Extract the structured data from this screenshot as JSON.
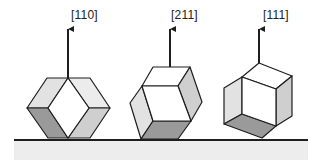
{
  "figure": {
    "colors": {
      "line": "#1e1e1e",
      "face_light": "#e2e2e2",
      "face_mid": "#cfcfcf",
      "face_dark": "#9a9a9a",
      "face_white": "#ffffff",
      "substrate": "#ededed"
    },
    "crystals": [
      {
        "label": "[110]",
        "label_pos": {
          "x": 71,
          "y": 9
        },
        "arrow": {
          "x": 68,
          "y1": 78,
          "y2": 26
        }
      },
      {
        "label": "[211]",
        "label_pos": {
          "x": 171,
          "y": 9
        },
        "arrow": {
          "x": 170,
          "y1": 67,
          "y2": 26
        }
      },
      {
        "label": "[111]",
        "label_pos": {
          "x": 263,
          "y": 9
        },
        "arrow": {
          "x": 259,
          "y1": 63,
          "y2": 26
        }
      }
    ]
  }
}
